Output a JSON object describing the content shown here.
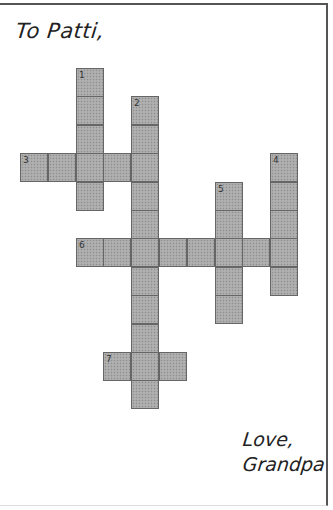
{
  "greeting": "To Patti,",
  "signoff": {
    "line1": "Love,",
    "line2": "Grandpa"
  },
  "colors": {
    "cell_fill": "#a9a9a9",
    "cell_border": "#666666",
    "frame": "#555555"
  },
  "grid": {
    "origin_x": 20,
    "origin_y": 68,
    "cell_w": 27.8,
    "cell_h": 28.4,
    "entries": [
      {
        "number": "1",
        "direction": "down",
        "col": 2,
        "row": 0,
        "length": 5
      },
      {
        "number": "2",
        "direction": "down",
        "col": 4,
        "row": 1,
        "length": 11
      },
      {
        "number": "3",
        "direction": "across",
        "col": 0,
        "row": 3,
        "length": 5
      },
      {
        "number": "4",
        "direction": "down",
        "col": 9,
        "row": 3,
        "length": 5
      },
      {
        "number": "5",
        "direction": "down",
        "col": 7,
        "row": 4,
        "length": 5
      },
      {
        "number": "6",
        "direction": "across",
        "col": 2,
        "row": 6,
        "length": 8
      },
      {
        "number": "7",
        "direction": "across",
        "col": 3,
        "row": 10,
        "length": 3
      }
    ]
  }
}
